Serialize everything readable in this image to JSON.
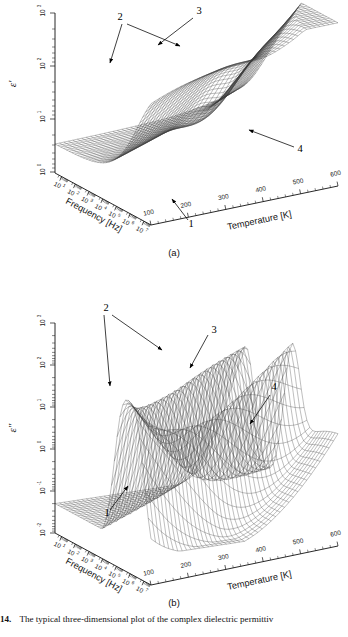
{
  "figure": {
    "caption_number": "14.",
    "caption_text": "The typical three-dimensional plot of the complex dielectric permittiv",
    "subcaption_a": "(a)",
    "subcaption_b": "(b)"
  },
  "panel_a": {
    "vertical_axis_label": "ε'",
    "frequency_axis_title": "Frequency [Hz]",
    "temperature_axis_title": "Temperature [K]",
    "annotations": [
      {
        "label": "1"
      },
      {
        "label": "2"
      },
      {
        "label": "3"
      },
      {
        "label": "4"
      }
    ]
  },
  "panel_b": {
    "vertical_axis_label": "ε\"",
    "frequency_axis_title": "Frequency [Hz]",
    "temperature_axis_title": "Temperature [K]",
    "annotations": [
      {
        "label": "1"
      },
      {
        "label": "2"
      },
      {
        "label": "3"
      },
      {
        "label": "4"
      }
    ]
  },
  "chart_data": [
    {
      "type": "surface",
      "id": "panel-a",
      "title": "(a)",
      "zlabel": "ε'",
      "xlabel": "Temperature [K]",
      "ylabel": "Frequency [Hz]",
      "zscale": "log",
      "zlim": [
        1,
        1000
      ],
      "zticks": [
        "10^0",
        "10^1",
        "10^2",
        "10^3"
      ],
      "zticks_text": [
        "10",
        "10",
        "10",
        "10"
      ],
      "zticks_exp": [
        "0",
        "1",
        "2",
        "3"
      ],
      "xlim": [
        100,
        600
      ],
      "xticks": [
        100,
        200,
        300,
        400,
        500,
        600
      ],
      "ylim": [
        10,
        10000000
      ],
      "yscale": "log",
      "yticks_exp": [
        "1",
        "2",
        "3",
        "4",
        "5",
        "6",
        "7"
      ],
      "description": "Real part of complex dielectric permittivity as a step-like surface: high plateau at low frequency / high temperature descending to a low plateau at high frequency, with a conductivity upturn ridge at high temperature.",
      "annotations": [
        {
          "label": "1",
          "points_to": "low-frequency flat baseline region at front of surface"
        },
        {
          "label": "2",
          "points_to": "left high plateau edge at low temperature"
        },
        {
          "label": "3",
          "points_to": "plateau crest ridge / relaxation step top"
        },
        {
          "label": "4",
          "points_to": "right descending flank at high temperature"
        }
      ]
    },
    {
      "type": "surface",
      "id": "panel-b",
      "title": "(b)",
      "zlabel": "ε\"",
      "xlabel": "Temperature [K]",
      "ylabel": "Frequency [Hz]",
      "zscale": "log",
      "zlim": [
        0.01,
        1000
      ],
      "zticks": [
        "10^-2",
        "10^-1",
        "10^0",
        "10^1",
        "10^2",
        "10^3"
      ],
      "zticks_text": [
        "10",
        "10",
        "10",
        "10",
        "10",
        "10"
      ],
      "zticks_exp": [
        "-2",
        "-1",
        "0",
        "1",
        "2",
        "3"
      ],
      "xlim": [
        100,
        600
      ],
      "xticks": [
        100,
        200,
        300,
        400,
        500,
        600
      ],
      "ylim": [
        10,
        10000000
      ],
      "yscale": "log",
      "yticks_exp": [
        "1",
        "2",
        "3",
        "4",
        "5",
        "6",
        "7"
      ],
      "description": "Imaginary part (dielectric loss) as a surface with two tall relaxation-peak ridges separated by a valley, and a low flat shelf at low temperature.",
      "annotations": [
        {
          "label": "1",
          "points_to": "low flat shelf front edge at low temperature"
        },
        {
          "label": "2",
          "points_to": "left shelf top edge"
        },
        {
          "label": "3",
          "points_to": "twin relaxation peak crests"
        },
        {
          "label": "4",
          "points_to": "right-hand conductivity ridge flank"
        }
      ]
    }
  ]
}
